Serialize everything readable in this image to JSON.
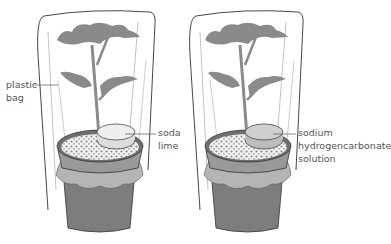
{
  "diagram": {
    "left_setup": {
      "labels": {
        "bag_line1": "plastic",
        "bag_line2": "bag",
        "dish_line1": "soda",
        "dish_line2": "lime"
      }
    },
    "right_setup": {
      "labels": {
        "dish_line1": "sodium",
        "dish_line2": "hydrogencarbonate",
        "dish_line3": "solution"
      }
    },
    "colors": {
      "leaf": "#8a8a8a",
      "pot_dark": "#7d7d7d",
      "pot_mid": "#999999",
      "tie_band": "#b5b5b5",
      "outline": "#333333",
      "soda_lime_dish": "#eeeeee",
      "solution_dish": "#cfcfcf",
      "label_text": "#555555"
    }
  }
}
